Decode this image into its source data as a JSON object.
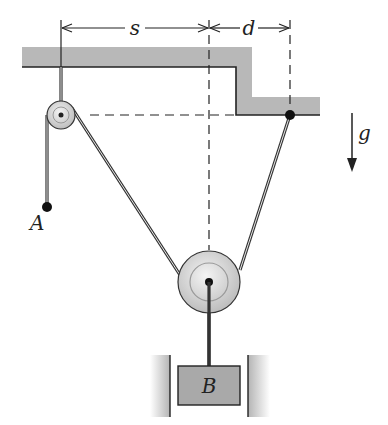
{
  "diagram": {
    "type": "pulley-system",
    "labels": {
      "dim_s": "s",
      "dim_d": "d",
      "gravity": "g",
      "point_a": "A",
      "block_b": "B"
    },
    "colors": {
      "ceiling_fill": "#b8b8b8",
      "block_fill": "#a9a9a9",
      "wall_fill": "#c4c4c4",
      "line": "#222222",
      "pulley_fill": "#dcdcdc"
    },
    "elements": [
      "ceiling with step",
      "small fixed pulley (upper left)",
      "rope end point A",
      "anchor point on lower ceiling step",
      "large movable pulley",
      "block B between vertical guide walls",
      "gravity arrow g pointing down",
      "dimension s (small pulley to large pulley centerline)",
      "dimension d (large pulley centerline to anchor)"
    ]
  }
}
